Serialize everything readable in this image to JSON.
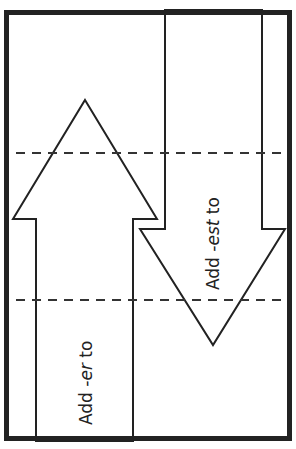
{
  "diagram": {
    "frame": {
      "x": 4,
      "y": 10,
      "w": 288,
      "h": 431,
      "stroke": "#222222",
      "stroke_width": 5
    },
    "dashed_lines": [
      {
        "y": 153
      },
      {
        "y": 300
      }
    ],
    "up_arrow": {
      "label_prefix": "Add ",
      "label_suffix_italic": "-er",
      "label_end": " to",
      "points": "85,100 157,219 133,219 133,441 36,441 36,219 13,219"
    },
    "down_arrow": {
      "label_prefix": "Add ",
      "label_suffix_italic": "-est",
      "label_end": " to",
      "points": "165,10 262,10 262,229 285,229 213,345 140,229 165,229"
    }
  }
}
